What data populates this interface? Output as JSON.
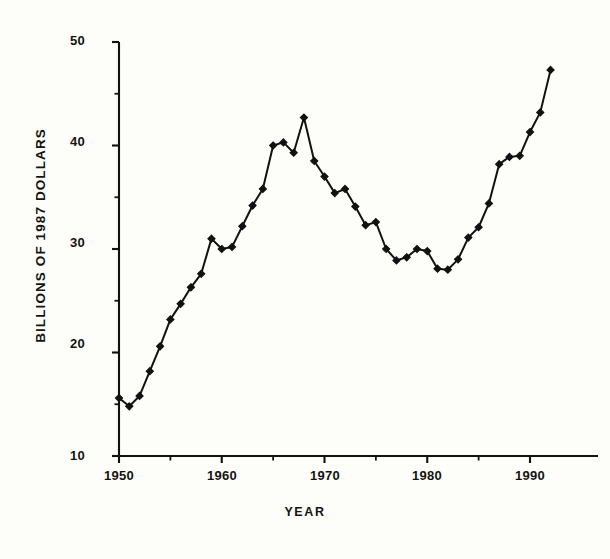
{
  "chart_data": {
    "type": "line",
    "title": "",
    "xlabel": "YEAR",
    "ylabel": "BILLIONS OF 1987 DOLLARS",
    "xlim": [
      1949,
      1993
    ],
    "ylim": [
      10,
      50
    ],
    "xticks": [
      1950,
      1960,
      1970,
      1980,
      1990
    ],
    "xtick_labels": [
      "1950",
      "1960",
      "1970",
      "1980",
      "1990"
    ],
    "yticks": [
      10,
      20,
      30,
      40,
      50
    ],
    "ytick_labels": [
      "10",
      "20",
      "30",
      "40",
      "50"
    ],
    "y_minor_ticks": [
      15,
      25,
      35,
      45
    ],
    "x_minor_ticks": [
      1955,
      1965,
      1975,
      1985
    ],
    "grid": false,
    "legend": null,
    "marker": "filled-diamond",
    "line_color": "#111111",
    "marker_color": "#111111",
    "background_color": "#fdfdfa",
    "x": [
      1950,
      1951,
      1952,
      1953,
      1954,
      1955,
      1956,
      1957,
      1958,
      1959,
      1960,
      1961,
      1962,
      1963,
      1964,
      1965,
      1966,
      1967,
      1968,
      1969,
      1970,
      1971,
      1972,
      1973,
      1974,
      1975,
      1976,
      1977,
      1978,
      1979,
      1980,
      1981,
      1982,
      1983,
      1984,
      1985,
      1986,
      1987,
      1988,
      1989,
      1990,
      1991,
      1992
    ],
    "values": [
      15.6,
      14.8,
      15.8,
      18.2,
      20.6,
      23.2,
      24.7,
      26.3,
      27.6,
      31.0,
      30.0,
      30.2,
      32.2,
      34.2,
      35.8,
      40.0,
      40.3,
      39.3,
      42.7,
      38.5,
      37.0,
      35.4,
      35.8,
      34.1,
      32.3,
      32.6,
      30.0,
      28.9,
      29.2,
      30.0,
      29.8,
      28.1,
      28.0,
      29.0,
      31.1,
      32.1,
      34.4,
      38.2,
      38.9,
      39.0,
      41.3,
      43.2,
      47.3
    ]
  },
  "axis": {
    "ytick_labels": [
      "50",
      "40",
      "30",
      "20",
      "10"
    ],
    "xtick_labels": [
      "1950",
      "1960",
      "1970",
      "1980",
      "1990"
    ],
    "xlabel": "YEAR",
    "ylabel": "BILLIONS OF 1987 DOLLARS"
  }
}
